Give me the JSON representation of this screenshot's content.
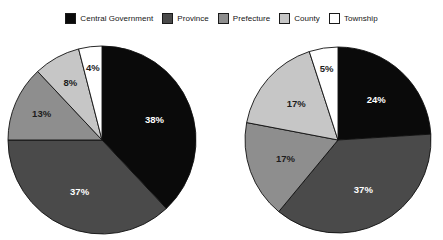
{
  "chart_data": {
    "type": "pie",
    "title": "",
    "legend_position": "top-center",
    "legend": [
      {
        "label": "Central Government",
        "color": "#0a0a0a"
      },
      {
        "label": "Province",
        "color": "#4a4a4a"
      },
      {
        "label": "Prefecture",
        "color": "#8e8e8e"
      },
      {
        "label": "County",
        "color": "#c6c6c6"
      },
      {
        "label": "Township",
        "color": "#ffffff"
      }
    ],
    "categories": [
      "Central Government",
      "Province",
      "Prefecture",
      "County",
      "Township"
    ],
    "charts": [
      {
        "name": "left-pie",
        "values": [
          38,
          37,
          13,
          8,
          4
        ],
        "labels": [
          "38%",
          "37%",
          "13%",
          "8%",
          "4%"
        ]
      },
      {
        "name": "right-pie",
        "values": [
          24,
          37,
          17,
          17,
          5
        ],
        "labels": [
          "24%",
          "37%",
          "17%",
          "17%",
          "5%"
        ]
      }
    ]
  },
  "legend": {
    "items": [
      {
        "label": "Central Government",
        "color": "#0a0a0a",
        "icon": "legend-swatch-central-government"
      },
      {
        "label": "Province",
        "color": "#4a4a4a",
        "icon": "legend-swatch-province"
      },
      {
        "label": "Prefecture",
        "color": "#8e8e8e",
        "icon": "legend-swatch-prefecture"
      },
      {
        "label": "County",
        "color": "#c6c6c6",
        "icon": "legend-swatch-county"
      },
      {
        "label": "Township",
        "color": "#ffffff",
        "icon": "legend-swatch-township"
      }
    ]
  },
  "pies": [
    {
      "name": "left-pie",
      "cx": 102,
      "cy": 140,
      "r": 94,
      "slices": [
        {
          "category": "Central Government",
          "value": 38,
          "label": "38%",
          "color": "#0a0a0a",
          "label_tone": "on-dark"
        },
        {
          "category": "Province",
          "value": 37,
          "label": "37%",
          "color": "#4a4a4a",
          "label_tone": "on-dark"
        },
        {
          "category": "Prefecture",
          "value": 13,
          "label": "13%",
          "color": "#8e8e8e",
          "label_tone": "on-light"
        },
        {
          "category": "County",
          "value": 8,
          "label": "8%",
          "color": "#c6c6c6",
          "label_tone": "on-light"
        },
        {
          "category": "Township",
          "value": 4,
          "label": "4%",
          "color": "#ffffff",
          "label_tone": "on-light"
        }
      ]
    },
    {
      "name": "right-pie",
      "cx": 338,
      "cy": 140,
      "r": 93,
      "slices": [
        {
          "category": "Central Government",
          "value": 24,
          "label": "24%",
          "color": "#0a0a0a",
          "label_tone": "on-dark"
        },
        {
          "category": "Province",
          "value": 37,
          "label": "37%",
          "color": "#4a4a4a",
          "label_tone": "on-dark"
        },
        {
          "category": "Prefecture",
          "value": 17,
          "label": "17%",
          "color": "#8e8e8e",
          "label_tone": "on-light"
        },
        {
          "category": "County",
          "value": 17,
          "label": "17%",
          "color": "#c6c6c6",
          "label_tone": "on-light"
        },
        {
          "category": "Township",
          "value": 5,
          "label": "5%",
          "color": "#ffffff",
          "label_tone": "on-light"
        }
      ]
    }
  ]
}
